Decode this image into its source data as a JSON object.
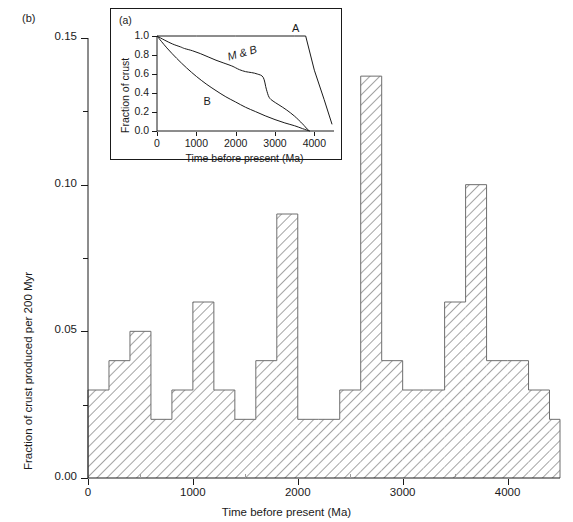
{
  "figure": {
    "panel_b_label": "(b)",
    "panel_a_label": "(a)"
  },
  "chart_data": [
    {
      "type": "bar",
      "panel": "(b)",
      "title": "",
      "xlabel": "Time before present (Ma)",
      "ylabel": "Fraction of crust produced per 200 Myr",
      "xlim": [
        0,
        4500
      ],
      "ylim": [
        0.0,
        0.15
      ],
      "bin_width": 200,
      "grid": false,
      "legend": "none",
      "fill": "diagonal-hatch",
      "xticks": [
        0,
        1000,
        2000,
        3000,
        4000
      ],
      "xticklabels": [
        "0",
        "1000",
        "2000",
        "3000",
        "4000"
      ],
      "xticks_minor": [
        500,
        1500,
        2500,
        3500
      ],
      "yticks": [
        0.0,
        0.05,
        0.1,
        0.15
      ],
      "yticklabels": [
        "0.00",
        "0.05",
        "0.10",
        "0.15"
      ],
      "yticks_minor": [
        0.025,
        0.075,
        0.125
      ],
      "bin_starts": [
        0,
        200,
        400,
        600,
        800,
        1000,
        1200,
        1400,
        1600,
        1800,
        2000,
        2200,
        2400,
        2600,
        2800,
        3000,
        3200,
        3400,
        3600,
        3800,
        4000,
        4200,
        4400
      ],
      "values": [
        0.03,
        0.04,
        0.05,
        0.02,
        0.03,
        0.06,
        0.03,
        0.02,
        0.04,
        0.09,
        0.02,
        0.02,
        0.03,
        0.137,
        0.04,
        0.03,
        0.03,
        0.06,
        0.1,
        0.04,
        0.04,
        0.03,
        0.02
      ]
    },
    {
      "type": "line",
      "panel": "(a)",
      "title": "",
      "xlabel": "Time before present (Ma)",
      "ylabel": "Fraction of crust",
      "xlim": [
        0,
        4500
      ],
      "ylim": [
        0.0,
        1.0
      ],
      "grid": false,
      "legend": "inline-labels",
      "xticks": [
        0,
        1000,
        2000,
        3000,
        4000
      ],
      "xticklabels": [
        "0",
        "1000",
        "2000",
        "3000",
        "4000"
      ],
      "yticks": [
        0.0,
        0.2,
        0.4,
        0.6,
        0.8,
        1.0
      ],
      "yticklabels": [
        "0.0",
        "0.2",
        "0.4",
        "0.6",
        "0.8",
        "1.0"
      ],
      "series": [
        {
          "name": "A",
          "label": "A",
          "label_x": 3430,
          "label_y": 1.07,
          "points": [
            [
              0,
              1.0
            ],
            [
              1000,
              1.0
            ],
            [
              2000,
              1.0
            ],
            [
              3000,
              1.0
            ],
            [
              3500,
              1.0
            ],
            [
              3780,
              1.0
            ],
            [
              4000,
              0.64
            ],
            [
              4250,
              0.33
            ],
            [
              4450,
              0.07
            ]
          ]
        },
        {
          "name": "M & B",
          "label": "M & B",
          "label_x": 1760,
          "label_y": 0.76,
          "points": [
            [
              0,
              1.0
            ],
            [
              200,
              0.955
            ],
            [
              400,
              0.915
            ],
            [
              600,
              0.885
            ],
            [
              700,
              0.868
            ],
            [
              900,
              0.845
            ],
            [
              1100,
              0.815
            ],
            [
              1300,
              0.78
            ],
            [
              1500,
              0.745
            ],
            [
              1700,
              0.715
            ],
            [
              1900,
              0.685
            ],
            [
              2000,
              0.665
            ],
            [
              2100,
              0.645
            ],
            [
              2250,
              0.625
            ],
            [
              2400,
              0.615
            ],
            [
              2550,
              0.6
            ],
            [
              2700,
              0.565
            ],
            [
              2780,
              0.44
            ],
            [
              2850,
              0.355
            ],
            [
              2950,
              0.315
            ],
            [
              3100,
              0.275
            ],
            [
              3300,
              0.22
            ],
            [
              3500,
              0.155
            ],
            [
              3700,
              0.075
            ],
            [
              3820,
              0.02
            ],
            [
              3880,
              0.0
            ]
          ]
        },
        {
          "name": "B",
          "label": "B",
          "label_x": 1180,
          "label_y": 0.295,
          "points": [
            [
              0,
              1.0
            ],
            [
              250,
              0.875
            ],
            [
              500,
              0.765
            ],
            [
              750,
              0.665
            ],
            [
              1000,
              0.575
            ],
            [
              1250,
              0.495
            ],
            [
              1500,
              0.425
            ],
            [
              1750,
              0.36
            ],
            [
              2000,
              0.305
            ],
            [
              2250,
              0.25
            ],
            [
              2500,
              0.205
            ],
            [
              2750,
              0.16
            ],
            [
              3000,
              0.12
            ],
            [
              3250,
              0.085
            ],
            [
              3500,
              0.055
            ],
            [
              3700,
              0.025
            ],
            [
              3880,
              0.0
            ]
          ]
        }
      ]
    }
  ]
}
